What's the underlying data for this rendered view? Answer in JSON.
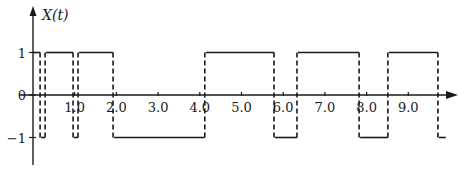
{
  "chart_data": {
    "type": "line",
    "subtype": "step",
    "title": "",
    "ylabel": "X(t)",
    "xlabel": "",
    "x_ticks": [
      "1.0",
      "2.0",
      "3.0",
      "4.0",
      "5.0",
      "6.0",
      "7.0",
      "8.0",
      "9.0"
    ],
    "x_tick_values": [
      1,
      2,
      3,
      4,
      5,
      6,
      7,
      8,
      9
    ],
    "y_ticks": [
      "1",
      "0",
      "−1"
    ],
    "y_tick_values": [
      1,
      0,
      -1
    ],
    "xlim": [
      0,
      10.2
    ],
    "ylim": [
      -1.6,
      1.8
    ],
    "grid": false,
    "legend": null,
    "transitions_style": "dashed vertical lines",
    "levels_style": "solid horizontal lines",
    "series": [
      {
        "name": "X(t)",
        "segments": [
          {
            "t_start": 0.0,
            "t_end": 0.17,
            "value": 1
          },
          {
            "t_start": 0.17,
            "t_end": 0.29,
            "value": -1
          },
          {
            "t_start": 0.29,
            "t_end": 0.96,
            "value": 1
          },
          {
            "t_start": 0.96,
            "t_end": 1.08,
            "value": -1
          },
          {
            "t_start": 1.08,
            "t_end": 1.92,
            "value": 1
          },
          {
            "t_start": 1.92,
            "t_end": 4.12,
            "value": -1
          },
          {
            "t_start": 4.12,
            "t_end": 5.78,
            "value": 1
          },
          {
            "t_start": 5.78,
            "t_end": 6.33,
            "value": -1
          },
          {
            "t_start": 6.33,
            "t_end": 7.82,
            "value": 1
          },
          {
            "t_start": 7.82,
            "t_end": 8.51,
            "value": -1
          },
          {
            "t_start": 8.51,
            "t_end": 9.71,
            "value": 1
          },
          {
            "t_start": 9.71,
            "t_end": 9.9,
            "value": -1
          }
        ],
        "transition_times": [
          0.17,
          0.29,
          0.96,
          1.08,
          1.92,
          4.12,
          5.78,
          6.33,
          7.82,
          8.51,
          9.71
        ]
      }
    ]
  }
}
